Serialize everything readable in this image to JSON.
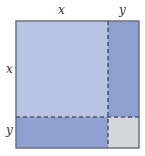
{
  "diagram": {
    "labels": {
      "top_x": "x",
      "top_y": "y",
      "left_x": "x",
      "left_y": "y"
    },
    "regions": [
      {
        "name": "x-squared",
        "color": "#b9c3e2"
      },
      {
        "name": "xy-right",
        "color": "#8f9fd0"
      },
      {
        "name": "xy-bottom",
        "color": "#8f9fd0"
      },
      {
        "name": "y-squared",
        "color": "#d3d5d8"
      }
    ],
    "border_color": "#6b7280",
    "dash_color": "#4b5563"
  }
}
